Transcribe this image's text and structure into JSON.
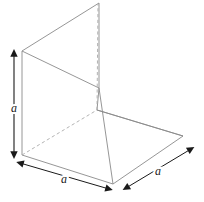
{
  "figure": {
    "background_color": "#ffffff",
    "line_color": "#8a8a8a",
    "hidden_line_color": "#aaaaaa",
    "arrow_color": "#1a1a1a",
    "label_color": "#1a1a1a"
  },
  "labels": {
    "height_label": "a",
    "base_front_label": "a",
    "base_side_label": "a"
  },
  "geometry": {
    "vertical_plate": {
      "name": "vertical-square-plate",
      "points": "22,51 99,3 99,88 97,110"
    },
    "base_plate": {
      "name": "horizontal-square-plate",
      "points": "22,155 97,110 183,136 113,184"
    },
    "hidden_edges": [
      "22,155 97,110",
      "97,110 97,88"
    ]
  },
  "dimensions": {
    "height_arrow": {
      "name": "height-dimension-arrow",
      "from_x": 14,
      "from_y": 52,
      "to_x": 14,
      "to_y": 156,
      "label": "a"
    },
    "front_arrow": {
      "name": "front-edge-dimension-arrow",
      "from_x": 19,
      "from_y": 163,
      "to_x": 110,
      "to_y": 190,
      "label": "a"
    },
    "side_arrow": {
      "name": "side-edge-dimension-arrow",
      "from_x": 125,
      "from_y": 188,
      "to_x": 192,
      "to_y": 149,
      "label": "a"
    }
  }
}
